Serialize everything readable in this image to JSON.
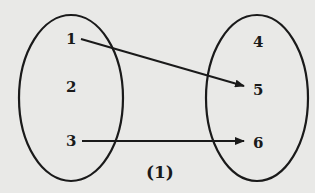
{
  "diagram": {
    "type": "mapping",
    "caption": "(1)",
    "domain_set": [
      "1",
      "2",
      "3"
    ],
    "codomain_set": [
      "4",
      "5",
      "6"
    ],
    "arrows": [
      {
        "from": "1",
        "to": "5"
      },
      {
        "from": "3",
        "to": "6"
      }
    ],
    "colors": {
      "background": "#e9e9e7",
      "ink": "#1a1a1a"
    }
  }
}
